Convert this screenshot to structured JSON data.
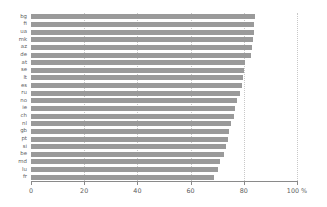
{
  "chart_data": {
    "type": "bar",
    "orientation": "horizontal",
    "title": "",
    "subtitle": "",
    "xlabel": "",
    "ylabel": "",
    "xlim": [
      0,
      100
    ],
    "xunit": "%",
    "grid": true,
    "legend": null,
    "bar_color": "#9a9a9a",
    "axis_color": "#8a8a8a",
    "grid_color": "#c8c8c8",
    "text_color": "#606060",
    "xticks": [
      {
        "value": 0,
        "label": "0"
      },
      {
        "value": 20,
        "label": "20"
      },
      {
        "value": 40,
        "label": "40"
      },
      {
        "value": 60,
        "label": "60"
      },
      {
        "value": 80,
        "label": "80"
      },
      {
        "value": 100,
        "label": "100 %"
      }
    ],
    "categories": [
      "bg",
      "fi",
      "ua",
      "mk",
      "az",
      "de",
      "at",
      "se",
      "lt",
      "es",
      "ru",
      "no",
      "ie",
      "ch",
      "nl",
      "gb",
      "pt",
      "si",
      "be",
      "md",
      "lu",
      "fr"
    ],
    "values": [
      84.2,
      84.0,
      83.8,
      83.4,
      83.0,
      82.6,
      80.6,
      80.2,
      79.8,
      79.4,
      78.4,
      77.6,
      76.6,
      76.2,
      75.2,
      74.6,
      74.0,
      73.4,
      72.4,
      71.0,
      70.2,
      68.8
    ]
  }
}
